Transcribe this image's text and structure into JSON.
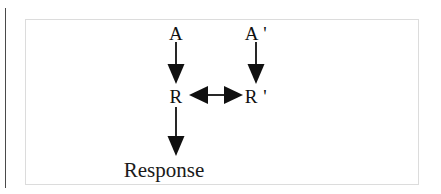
{
  "figure": {
    "background_color": "#ffffff",
    "frame_color": "#dcdcdc",
    "ink_color": "#101010",
    "gutter_line_color": "#4a4a4a"
  },
  "diagram": {
    "type": "flow-diagram",
    "nodes": [
      {
        "id": "A",
        "label": "A",
        "x": 176,
        "y": 33
      },
      {
        "id": "A-prime",
        "label": "A '",
        "x": 256,
        "y": 33
      },
      {
        "id": "R",
        "label": "R",
        "x": 176,
        "y": 96
      },
      {
        "id": "R-prime",
        "label": "R '",
        "x": 256,
        "y": 96
      },
      {
        "id": "Response",
        "label": "Response",
        "x": 164,
        "y": 170
      }
    ],
    "arrows": [
      {
        "id": "A-to-R",
        "from": "A",
        "to": "R",
        "direction": "down",
        "x": 176,
        "y1": 42,
        "y2": 84
      },
      {
        "id": "A-prime-to-R-prime",
        "from": "A-prime",
        "to": "R-prime",
        "direction": "down",
        "x": 256,
        "y1": 42,
        "y2": 84
      },
      {
        "id": "R-to-R-prime",
        "from": "R",
        "to": "R-prime",
        "direction": "both",
        "y": 96,
        "x1": 190,
        "x2": 242
      },
      {
        "id": "R-to-Response",
        "from": "R",
        "to": "Response",
        "direction": "down",
        "x": 176,
        "y1": 106,
        "y2": 156
      }
    ]
  }
}
